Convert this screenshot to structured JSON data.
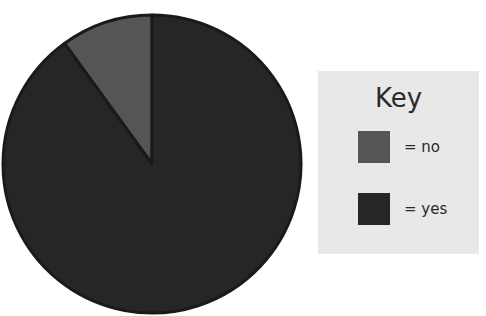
{
  "chart_data": {
    "type": "pie",
    "title": "",
    "slices": [
      {
        "label": "no",
        "value": 10,
        "color": "#555555"
      },
      {
        "label": "yes",
        "value": 90,
        "color": "#262626"
      }
    ],
    "start_angle": "12 o'clock",
    "direction": "counterclockwise for 'no' slice",
    "legend": {
      "title": "Key",
      "position": "right",
      "entries": [
        "= no",
        "= yes"
      ]
    }
  },
  "legend": {
    "title": "Key",
    "items": [
      {
        "label": "= no",
        "color": "#555555"
      },
      {
        "label": "= yes",
        "color": "#262626"
      }
    ]
  }
}
